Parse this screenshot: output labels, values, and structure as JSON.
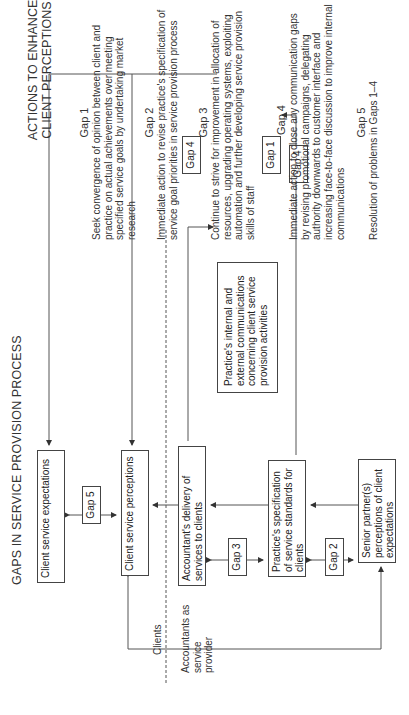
{
  "left_title": "GAPS IN SERVICE PROVISION PROCESS",
  "right_title": "ACTIONS TO ENHANCE CLIENT PERCEPTIONS",
  "sides": {
    "clients": "Clients",
    "accountants": "Accountants as service provider"
  },
  "boxes": {
    "client_expectations": "Client service expectations",
    "client_perceptions": "Client service perceptions",
    "accountant_delivery": "Accountant's delivery of services to clients",
    "practice_specification": "Practice's specification of service standards for clients",
    "senior_partner": "Senior partner(s) perceptions of client expectations",
    "communications": "Practice's internal and external communications concerning client service provision activities"
  },
  "gap_labels": {
    "gap1": "Gap 1",
    "gap2": "Gap 2",
    "gap3": "Gap 3",
    "gap4a": "Gap 4",
    "gap4b": "Gap 4",
    "gap5": "Gap 5"
  },
  "actions": [
    {
      "heading": "Gap 1",
      "text": "Seek convergence of opinion between client and practice on actual achievements over meeting specified service goals by undertaking market research"
    },
    {
      "heading": "Gap 2",
      "text": "Immediate action to revise practice's specification of service goal priorities in service provision process"
    },
    {
      "heading": "Gap 3",
      "text": "Continue to strive for improvement in allocation of resources, upgrading operating systems, exploiting automation and further developing service provision skills of staff"
    },
    {
      "heading": "Gap 4",
      "text": "Immediate action to close any communication gaps by revising promotional campaigns, delegating authority downwards to customer interface and increasing face-to-face discussion to improve internal communications"
    },
    {
      "heading": "Gap 5",
      "text": "Resolution of problems in Gaps 1–4"
    }
  ],
  "colors": {
    "line": "#444444",
    "text": "#222222",
    "background": "#ffffff"
  }
}
